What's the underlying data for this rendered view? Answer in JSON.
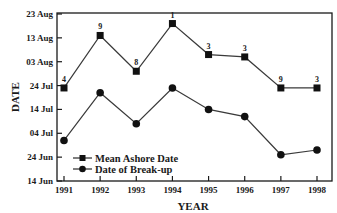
{
  "chart_data": {
    "type": "line",
    "title": "",
    "xlabel": "YEAR",
    "ylabel": "DATE",
    "categories": [
      "1991",
      "1992",
      "1993",
      "1994",
      "1995",
      "1996",
      "1997",
      "1998"
    ],
    "y_ticks": [
      "14 Jun",
      "24 Jun",
      "04 Jul",
      "14 Jul",
      "24 Jul",
      "03 Aug",
      "13 Aug",
      "23 Aug"
    ],
    "ylim": [
      "14 Jun",
      "23 Aug"
    ],
    "grid": false,
    "legend_position": "lower-left inside",
    "series": [
      {
        "name": "Mean Ashore Date",
        "marker": "square",
        "values": [
          "23 Jul",
          "14 Aug",
          "30 Jul",
          "19 Aug",
          "06 Aug",
          "05 Aug",
          "23 Jul",
          "23 Jul"
        ],
        "day_offsets_from_14_Jun": [
          39,
          61,
          46,
          66,
          53,
          52,
          39,
          39
        ],
        "point_labels": [
          "4",
          "9",
          "8",
          "1",
          "3",
          "3",
          "9",
          "3"
        ]
      },
      {
        "name": "Date of Break-up",
        "marker": "circle",
        "values": [
          "01 Jul",
          "21 Jul",
          "08 Jul",
          "23 Jul",
          "14 Jul",
          "11 Jul",
          "25 Jun",
          "27 Jun"
        ],
        "day_offsets_from_14_Jun": [
          17,
          37,
          24,
          39,
          30,
          27,
          11,
          13
        ]
      }
    ]
  },
  "colors": {
    "line": "#3a3a3a",
    "marker": "#111111",
    "axis": "#1a1a1a"
  }
}
